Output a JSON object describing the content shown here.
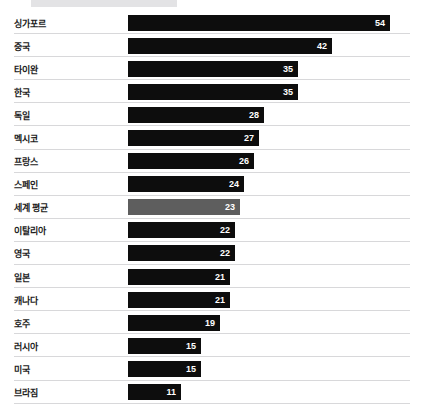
{
  "chart": {
    "type": "bar",
    "orientation": "horizontal",
    "highlight_color": "#5e5e5e",
    "bar_color": "#0d0d0d",
    "gridline_color": "#d8d8da"
  },
  "chart_data": {
    "type": "bar",
    "title": "",
    "xlabel": "",
    "ylabel": "",
    "xlim": [
      0,
      58
    ],
    "grid": true,
    "legend": false,
    "orientation": "horizontal",
    "categories": [
      "싱가포르",
      "중국",
      "타이완",
      "한국",
      "독일",
      "멕시코",
      "프랑스",
      "스페인",
      "세계 평균",
      "이탈리아",
      "영국",
      "일본",
      "캐나다",
      "호주",
      "러시아",
      "미국",
      "브라짐"
    ],
    "values": [
      54,
      42,
      35,
      35,
      28,
      27,
      26,
      24,
      23,
      22,
      22,
      21,
      21,
      19,
      15,
      15,
      11
    ],
    "highlighted_categories": [
      "세계 평균"
    ]
  },
  "rows": [
    {
      "label": "싱가포르",
      "value": 54,
      "value_text": "54",
      "highlight": false
    },
    {
      "label": "중국",
      "value": 42,
      "value_text": "42",
      "highlight": false
    },
    {
      "label": "타이완",
      "value": 35,
      "value_text": "35",
      "highlight": false
    },
    {
      "label": "한국",
      "value": 35,
      "value_text": "35",
      "highlight": false
    },
    {
      "label": "독일",
      "value": 28,
      "value_text": "28",
      "highlight": false
    },
    {
      "label": "멕시코",
      "value": 27,
      "value_text": "27",
      "highlight": false
    },
    {
      "label": "프랑스",
      "value": 26,
      "value_text": "26",
      "highlight": false
    },
    {
      "label": "스페인",
      "value": 24,
      "value_text": "24",
      "highlight": false
    },
    {
      "label": "세계 평균",
      "value": 23,
      "value_text": "23",
      "highlight": true
    },
    {
      "label": "이탈리아",
      "value": 22,
      "value_text": "22",
      "highlight": false
    },
    {
      "label": "영국",
      "value": 22,
      "value_text": "22",
      "highlight": false
    },
    {
      "label": "일본",
      "value": 21,
      "value_text": "21",
      "highlight": false
    },
    {
      "label": "캐나다",
      "value": 21,
      "value_text": "21",
      "highlight": false
    },
    {
      "label": "호주",
      "value": 19,
      "value_text": "19",
      "highlight": false
    },
    {
      "label": "러시아",
      "value": 15,
      "value_text": "15",
      "highlight": false
    },
    {
      "label": "미국",
      "value": 15,
      "value_text": "15",
      "highlight": false
    },
    {
      "label": "브라짐",
      "value": 11,
      "value_text": "11",
      "highlight": false
    }
  ]
}
